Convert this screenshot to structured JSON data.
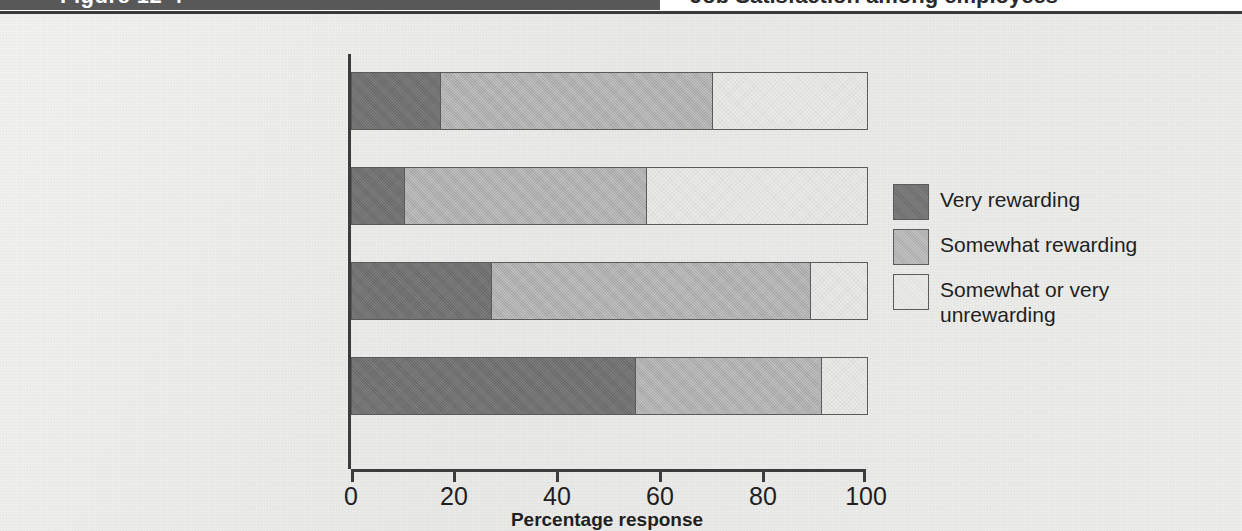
{
  "header": {
    "figure_tag": "Figure 12-4",
    "title": "Job Satisfaction among employees"
  },
  "chart_data": {
    "type": "bar",
    "orientation": "horizontal",
    "stacked": true,
    "title": "Job Satisfaction among employees",
    "xlabel": "Percentage response",
    "ylabel": "",
    "xlim": [
      0,
      100
    ],
    "xticks": [
      0,
      20,
      40,
      60,
      80,
      100
    ],
    "xtick_labels": [
      "0",
      "20",
      "40",
      "60",
      "80",
      "100"
    ],
    "grid": false,
    "legend_position": "right",
    "categories": [
      "Work for the public sector",
      "Work for large firms",
      "Work for small firms",
      "Self-employed"
    ],
    "series": [
      {
        "name": "Very rewarding",
        "color": "#6f6f6f",
        "values": [
          17,
          10,
          27,
          55
        ]
      },
      {
        "name": "Somewhat rewarding",
        "color": "#aeaeae",
        "values": [
          53,
          47,
          62,
          36
        ]
      },
      {
        "name": "Somewhat or very unrewarding",
        "color": "#e9e9e7",
        "values": [
          30,
          43,
          11,
          9
        ]
      }
    ],
    "legend": [
      {
        "label": "Very rewarding",
        "color": "#6f6f6f"
      },
      {
        "label": "Somewhat rewarding",
        "color": "#aeaeae"
      },
      {
        "label": "Somewhat or very\nunrewarding",
        "color": "#e9e9e7"
      }
    ]
  }
}
